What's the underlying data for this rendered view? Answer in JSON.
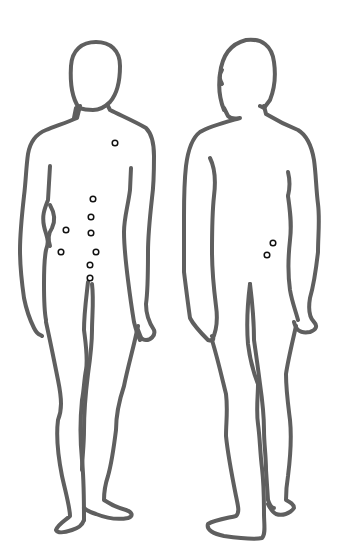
{
  "diagram": {
    "type": "body-map",
    "figures": [
      {
        "id": "front",
        "view": "front-view",
        "markers": [
          {
            "x": 115,
            "y": 143
          },
          {
            "x": 93,
            "y": 199
          },
          {
            "x": 91,
            "y": 217
          },
          {
            "x": 91,
            "y": 233
          },
          {
            "x": 66,
            "y": 230
          },
          {
            "x": 61,
            "y": 252
          },
          {
            "x": 96,
            "y": 252
          },
          {
            "x": 90,
            "y": 265
          },
          {
            "x": 90,
            "y": 278
          }
        ]
      },
      {
        "id": "back",
        "view": "back-view",
        "markers": [
          {
            "x": 273,
            "y": 243
          },
          {
            "x": 267,
            "y": 255
          }
        ]
      }
    ],
    "colors": {
      "outline": "#5f5f5f",
      "marker": "#111111",
      "background": "#ffffff"
    }
  }
}
